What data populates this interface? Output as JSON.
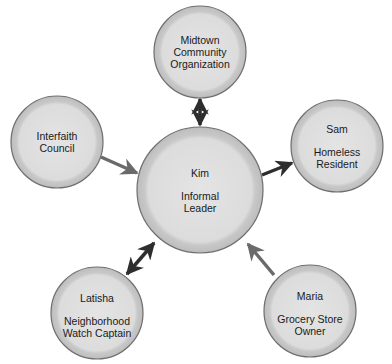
{
  "diagram": {
    "colors": {
      "circle_fill": "#d6d6d6",
      "circle_inner": "#e2e2e2",
      "circle_border": "#6e6e6e",
      "arrow_dark": "#2e2e2e",
      "arrow_medium": "#6a6a6a"
    },
    "center": {
      "name": "Kim",
      "role_line1": "Informal",
      "role_line2": "Leader"
    },
    "nodes": [
      {
        "id": "midtown",
        "line1": "Midtown",
        "line2": "Community",
        "line3": "Organization",
        "relation": "bidirectional"
      },
      {
        "id": "interfaith",
        "line1": "Interfaith",
        "line2": "Council",
        "relation": "to-center"
      },
      {
        "id": "sam",
        "name": "Sam",
        "role_line1": "Homeless",
        "role_line2": "Resident",
        "relation": "from-center"
      },
      {
        "id": "latisha",
        "name": "Latisha",
        "role_line1": "Neighborhood",
        "role_line2": "Watch Captain",
        "relation": "bidirectional"
      },
      {
        "id": "maria",
        "name": "Maria",
        "role_line1": "Grocery Store",
        "role_line2": "Owner",
        "relation": "to-center"
      }
    ]
  }
}
